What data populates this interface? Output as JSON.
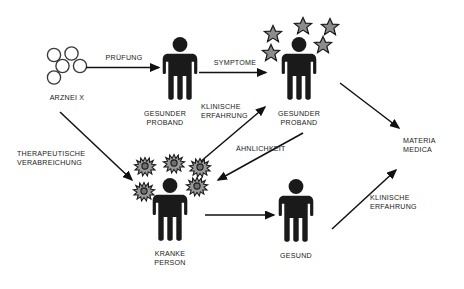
{
  "diagram": {
    "type": "flow-diagram",
    "title_visible": false,
    "colors": {
      "figure": "#1a1a1a",
      "text": "#1a1a1a",
      "arrow": "#111111",
      "star_fill": "#8c8c8c",
      "star_stroke": "#1a1a1a",
      "germ_fill": "#9a9a9a",
      "germ_stroke": "#1a1a1a",
      "molecule_stroke": "#3a3a3a",
      "background": "#ffffff"
    },
    "nodes": [
      {
        "id": "drug",
        "label": "ARZNEI X",
        "icon": "molecule-cluster-icon",
        "x": 67,
        "y": 98
      },
      {
        "id": "healthy1",
        "label": "GESUNDER\nPROBAND",
        "icon": "person-icon",
        "x": 165,
        "y": 114
      },
      {
        "id": "healthy2",
        "label": "GESUNDER\nPROBAND",
        "icon": "person-with-stars-icon",
        "x": 299,
        "y": 114
      },
      {
        "id": "sick",
        "label": "KRANKE\nPERSON",
        "icon": "person-with-germs-icon",
        "x": 170,
        "y": 254
      },
      {
        "id": "cured",
        "label": "GESUND",
        "icon": "person-icon",
        "x": 295,
        "y": 256
      },
      {
        "id": "materiamedica",
        "label": "MATERIA\nMEDICA",
        "icon": "text-node",
        "x": 412,
        "y": 141
      }
    ],
    "edges": [
      {
        "id": "e1",
        "from": "drug",
        "to": "healthy1",
        "label": "PRÜFUNG",
        "label_x": 124,
        "label_y": 57,
        "label_align": "center"
      },
      {
        "id": "e2",
        "from": "healthy1",
        "to": "healthy2",
        "label": "SYMPTOME",
        "label_x": 235,
        "label_y": 62,
        "label_align": "center"
      },
      {
        "id": "e3",
        "from": "drug",
        "to": "sick",
        "label": "THERAPEUTISCHE\nVERABREICHUNG",
        "label_x": 18,
        "label_y": 153,
        "label_align": "left"
      },
      {
        "id": "e4",
        "from": "sick",
        "to": "healthy2",
        "label": "KLINISCHE\nERFAHRUNG",
        "label_x": 200,
        "label_y": 107,
        "label_align": "left"
      },
      {
        "id": "e5",
        "from": "healthy2",
        "to": "sick",
        "label": "ÄHNLICHKEIT",
        "label_x": 241,
        "label_y": 148,
        "label_align": "left"
      },
      {
        "id": "e6",
        "from": "sick",
        "to": "cured",
        "label": "",
        "label_x": 0,
        "label_y": 0,
        "label_align": "left"
      },
      {
        "id": "e7",
        "from": "healthy2",
        "to": "materiamedica",
        "label": "",
        "label_x": 0,
        "label_y": 0,
        "label_align": "left"
      },
      {
        "id": "e8",
        "from": "cured",
        "to": "materiamedica",
        "label": "KLINISCHE\nERFAHRUNG",
        "label_x": 371,
        "label_y": 197,
        "label_align": "left"
      }
    ],
    "labels": {
      "drug": "ARZNEI X",
      "healthy_subject_1_line1": "GESUNDER",
      "healthy_subject_1_line2": "PROBAND",
      "healthy_subject_2_line1": "GESUNDER",
      "healthy_subject_2_line2": "PROBAND",
      "sick_person_line1": "KRANKE",
      "sick_person_line2": "PERSON",
      "cured_person": "GESUND",
      "materia_medica_line1": "MATERIA",
      "materia_medica_line2": "MEDICA",
      "edge_pruefung": "PRÜFUNG",
      "edge_symptome": "SYMPTOME",
      "edge_therapeutische_line1": "THERAPEUTISCHE",
      "edge_therapeutische_line2": "VERABREICHUNG",
      "edge_klinische_mid_line1": "KLINISCHE",
      "edge_klinische_mid_line2": "ERFAHRUNG",
      "edge_aehnlichkeit": "ÄHNLICHKEIT",
      "edge_klinische_right_line1": "KLINISCHE",
      "edge_klinische_right_line2": "ERFAHRUNG"
    },
    "counts": {
      "molecules": 5,
      "stars": 5,
      "germs": 5
    }
  }
}
